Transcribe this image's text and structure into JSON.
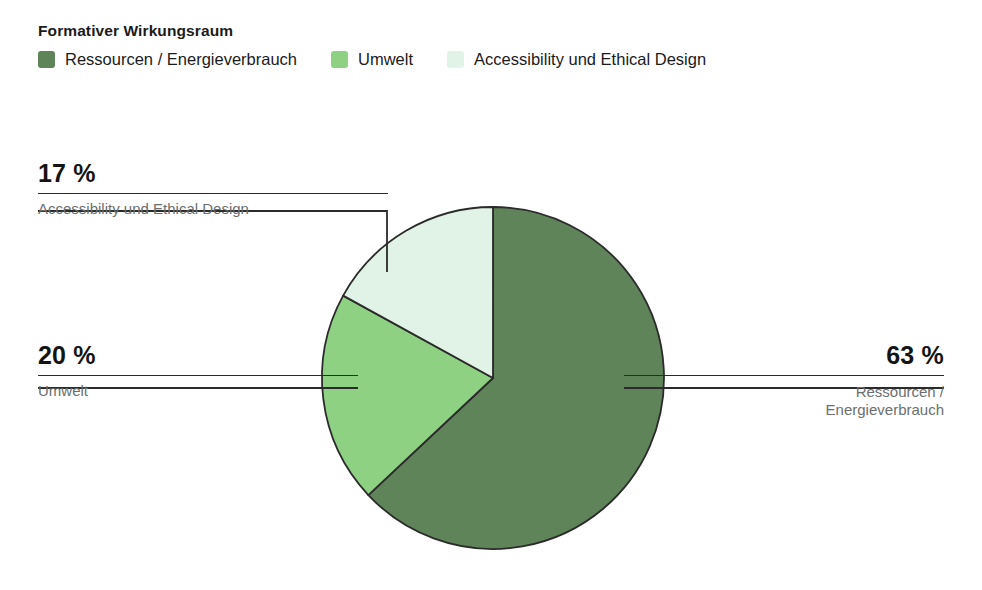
{
  "header": {
    "title": "Formativer Wirkungsraum"
  },
  "legend": {
    "items": [
      {
        "label": "Ressourcen / Energieverbrauch",
        "color": "#5f8459",
        "swatch_name": "legend-swatch-ressourcen"
      },
      {
        "label": "Umwelt",
        "color": "#8fd183",
        "swatch_name": "legend-swatch-umwelt"
      },
      {
        "label": "Accessibility und Ethical Design",
        "color": "#e1f3e6",
        "swatch_name": "legend-swatch-accessibility"
      }
    ]
  },
  "callouts": {
    "accessibility": {
      "value": "17 %",
      "name": "Accessibility und Ethical Design"
    },
    "umwelt": {
      "value": "20 %",
      "name": "Umwelt"
    },
    "ressourcen": {
      "value": "63 %",
      "name": "Ressourcen /\nEnergieverbrauch"
    }
  },
  "chart_data": {
    "type": "pie",
    "title": "Formativer Wirkungsraum",
    "labels": [
      "Ressourcen / Energieverbrauch",
      "Umwelt",
      "Accessibility und Ethical Design"
    ],
    "values": [
      63,
      20,
      17
    ],
    "value_labels": [
      "63 %",
      "20 %",
      "17 %"
    ],
    "unit": "%",
    "colors": [
      "#5f8459",
      "#8fd183",
      "#e1f3e6"
    ],
    "stroke_color": "#2b2b2b",
    "start_angle_deg": 0,
    "direction": "clockwise",
    "legend_position": "top",
    "grid": false,
    "geometry": {
      "center_x": 493,
      "center_y": 378,
      "radius": 171
    },
    "leader_lines": [
      {
        "series": "Accessibility und Ethical Design",
        "points": [
          [
            38,
            211
          ],
          [
            387,
            211
          ],
          [
            387,
            272
          ]
        ]
      },
      {
        "series": "Umwelt",
        "points": [
          [
            38,
            388
          ],
          [
            358,
            388
          ]
        ]
      },
      {
        "series": "Ressourcen / Energieverbrauch",
        "points": [
          [
            944,
            388
          ],
          [
            624,
            388
          ]
        ]
      }
    ]
  }
}
